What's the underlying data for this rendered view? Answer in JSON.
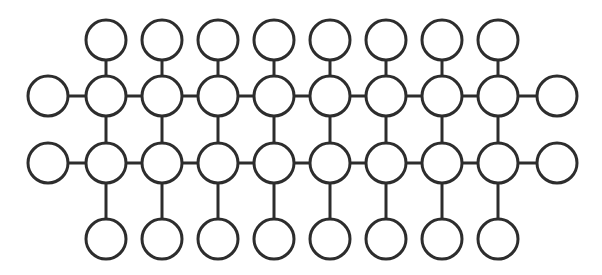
{
  "figure": {
    "type": "graph-diagram",
    "canvas": {
      "width": 602,
      "height": 275,
      "background": "#ffffff"
    },
    "style": {
      "stroke_color": "#2d2d2d",
      "stroke_width": 3,
      "node_fill": "#ffffff",
      "node_radius": 20
    },
    "geometry": {
      "row_y": {
        "top": 40,
        "rail_upper": 96,
        "rail_lower": 163,
        "bottom": 239
      },
      "column_x_start": 106,
      "column_spacing": 56,
      "column_count": 8,
      "left_end_x": 48,
      "right_end_x": 557
    },
    "counts": {
      "total_nodes": 36,
      "top_pendant_nodes": 8,
      "upper_rail_nodes": 8,
      "lower_rail_nodes": 8,
      "bottom_pendant_nodes": 8,
      "left_end_nodes": 2,
      "right_end_nodes": 2,
      "rails": 2
    },
    "nodes": [
      {
        "id": "left-upper-end",
        "cx": 48,
        "cy": 96,
        "r": 20,
        "group": "left-end"
      },
      {
        "id": "left-lower-end",
        "cx": 48,
        "cy": 163,
        "r": 20,
        "group": "left-end"
      },
      {
        "id": "top-1",
        "cx": 106,
        "cy": 40,
        "r": 20,
        "group": "top-pendant"
      },
      {
        "id": "top-2",
        "cx": 162,
        "cy": 40,
        "r": 20,
        "group": "top-pendant"
      },
      {
        "id": "top-3",
        "cx": 218,
        "cy": 40,
        "r": 20,
        "group": "top-pendant"
      },
      {
        "id": "top-4",
        "cx": 274,
        "cy": 40,
        "r": 20,
        "group": "top-pendant"
      },
      {
        "id": "top-5",
        "cx": 330,
        "cy": 40,
        "r": 20,
        "group": "top-pendant"
      },
      {
        "id": "top-6",
        "cx": 386,
        "cy": 40,
        "r": 20,
        "group": "top-pendant"
      },
      {
        "id": "top-7",
        "cx": 442,
        "cy": 40,
        "r": 20,
        "group": "top-pendant"
      },
      {
        "id": "top-8",
        "cx": 498,
        "cy": 40,
        "r": 20,
        "group": "top-pendant"
      },
      {
        "id": "upper-1",
        "cx": 106,
        "cy": 96,
        "r": 20,
        "group": "upper-rail"
      },
      {
        "id": "upper-2",
        "cx": 162,
        "cy": 96,
        "r": 20,
        "group": "upper-rail"
      },
      {
        "id": "upper-3",
        "cx": 218,
        "cy": 96,
        "r": 20,
        "group": "upper-rail"
      },
      {
        "id": "upper-4",
        "cx": 274,
        "cy": 96,
        "r": 20,
        "group": "upper-rail"
      },
      {
        "id": "upper-5",
        "cx": 330,
        "cy": 96,
        "r": 20,
        "group": "upper-rail"
      },
      {
        "id": "upper-6",
        "cx": 386,
        "cy": 96,
        "r": 20,
        "group": "upper-rail"
      },
      {
        "id": "upper-7",
        "cx": 442,
        "cy": 96,
        "r": 20,
        "group": "upper-rail"
      },
      {
        "id": "upper-8",
        "cx": 498,
        "cy": 96,
        "r": 20,
        "group": "upper-rail"
      },
      {
        "id": "lower-1",
        "cx": 106,
        "cy": 163,
        "r": 20,
        "group": "lower-rail"
      },
      {
        "id": "lower-2",
        "cx": 162,
        "cy": 163,
        "r": 20,
        "group": "lower-rail"
      },
      {
        "id": "lower-3",
        "cx": 218,
        "cy": 163,
        "r": 20,
        "group": "lower-rail"
      },
      {
        "id": "lower-4",
        "cx": 274,
        "cy": 163,
        "r": 20,
        "group": "lower-rail"
      },
      {
        "id": "lower-5",
        "cx": 330,
        "cy": 163,
        "r": 20,
        "group": "lower-rail"
      },
      {
        "id": "lower-6",
        "cx": 386,
        "cy": 163,
        "r": 20,
        "group": "lower-rail"
      },
      {
        "id": "lower-7",
        "cx": 442,
        "cy": 163,
        "r": 20,
        "group": "lower-rail"
      },
      {
        "id": "lower-8",
        "cx": 498,
        "cy": 163,
        "r": 20,
        "group": "lower-rail"
      },
      {
        "id": "bottom-1",
        "cx": 106,
        "cy": 239,
        "r": 20,
        "group": "bottom-pendant"
      },
      {
        "id": "bottom-2",
        "cx": 162,
        "cy": 239,
        "r": 20,
        "group": "bottom-pendant"
      },
      {
        "id": "bottom-3",
        "cx": 218,
        "cy": 239,
        "r": 20,
        "group": "bottom-pendant"
      },
      {
        "id": "bottom-4",
        "cx": 274,
        "cy": 239,
        "r": 20,
        "group": "bottom-pendant"
      },
      {
        "id": "bottom-5",
        "cx": 330,
        "cy": 239,
        "r": 20,
        "group": "bottom-pendant"
      },
      {
        "id": "bottom-6",
        "cx": 386,
        "cy": 239,
        "r": 20,
        "group": "bottom-pendant"
      },
      {
        "id": "bottom-7",
        "cx": 442,
        "cy": 239,
        "r": 20,
        "group": "bottom-pendant"
      },
      {
        "id": "bottom-8",
        "cx": 498,
        "cy": 239,
        "r": 20,
        "group": "bottom-pendant"
      },
      {
        "id": "right-upper-end",
        "cx": 557,
        "cy": 96,
        "r": 20,
        "group": "right-end"
      },
      {
        "id": "right-lower-end",
        "cx": 557,
        "cy": 163,
        "r": 20,
        "group": "right-end"
      }
    ],
    "edges": [
      {
        "id": "rail-upper",
        "x1": 48,
        "y1": 96,
        "x2": 557,
        "y2": 96,
        "kind": "horizontal-rail"
      },
      {
        "id": "rail-lower",
        "x1": 48,
        "y1": 163,
        "x2": 557,
        "y2": 163,
        "kind": "horizontal-rail"
      },
      {
        "id": "rung-1",
        "x1": 106,
        "y1": 40,
        "x2": 106,
        "y2": 239,
        "kind": "vertical-rung"
      },
      {
        "id": "rung-2",
        "x1": 162,
        "y1": 40,
        "x2": 162,
        "y2": 239,
        "kind": "vertical-rung"
      },
      {
        "id": "rung-3",
        "x1": 218,
        "y1": 40,
        "x2": 218,
        "y2": 239,
        "kind": "vertical-rung"
      },
      {
        "id": "rung-4",
        "x1": 274,
        "y1": 40,
        "x2": 274,
        "y2": 239,
        "kind": "vertical-rung"
      },
      {
        "id": "rung-5",
        "x1": 330,
        "y1": 40,
        "x2": 330,
        "y2": 239,
        "kind": "vertical-rung"
      },
      {
        "id": "rung-6",
        "x1": 386,
        "y1": 40,
        "x2": 386,
        "y2": 239,
        "kind": "vertical-rung"
      },
      {
        "id": "rung-7",
        "x1": 442,
        "y1": 40,
        "x2": 442,
        "y2": 239,
        "kind": "vertical-rung"
      },
      {
        "id": "rung-8",
        "x1": 498,
        "y1": 40,
        "x2": 498,
        "y2": 239,
        "kind": "vertical-rung"
      }
    ]
  }
}
